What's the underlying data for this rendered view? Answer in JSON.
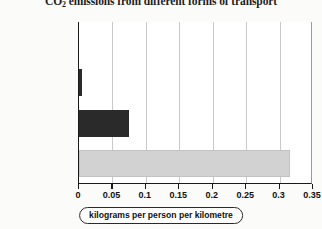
{
  "chart_data": {
    "type": "bar",
    "orientation": "horizontal",
    "title": "CO2 emissions from different forms of transport",
    "title_prefix": "CO",
    "title_subscript": "2",
    "title_suffix": " emissions from different forms of transport",
    "categories": [
      "cycle or walk",
      "bus or train",
      "car – 4 people",
      "car – driver only"
    ],
    "values": [
      0,
      0.005,
      0.075,
      0.315
    ],
    "bar_colors": [
      "#2a2a2a",
      "#2a2a2a",
      "#2a2a2a",
      "#d2d2d2"
    ],
    "xlabel": "kilograms per person per kilometre",
    "ylabel": "",
    "xlim": [
      0,
      0.35
    ],
    "xticks": [
      0,
      0.05,
      0.1,
      0.15,
      0.2,
      0.25,
      0.3,
      0.35
    ],
    "xtick_labels": [
      "0",
      "0.05",
      "0.1",
      "0.15",
      "0.2",
      "0.25",
      "0.3",
      "0.35"
    ],
    "grid": "vertical",
    "legend": "none"
  },
  "colors": {
    "dark_bar": "#2a2a2a",
    "light_bar": "#d2d2d2",
    "axis": "#1a1a1a",
    "gridline": "#c9c9c9",
    "page_background": "#fbfbfa",
    "text": "#111111"
  }
}
